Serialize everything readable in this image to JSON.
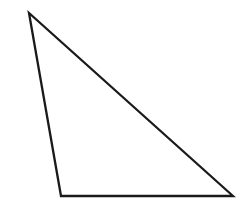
{
  "canvas": {
    "width": 247,
    "height": 215,
    "background_color": "#ffffff",
    "description": "Line drawing of a single scalene obtuse triangle outline"
  },
  "figure": {
    "name": "triangle",
    "shape_type": "triangle",
    "classification": "scalene obtuse triangle",
    "stroke_color": "#1a1a1a",
    "stroke_width": 2.3,
    "fill": "none",
    "points_attr": "29,13 61,196 233,196",
    "vertices": [
      {
        "label": "apex",
        "x": 29,
        "y": 13
      },
      {
        "label": "bottom-left",
        "x": 61,
        "y": 196
      },
      {
        "label": "bottom-right",
        "x": 233,
        "y": 196
      }
    ],
    "edges": [
      {
        "name": "left-edge",
        "from": "apex",
        "to": "bottom-left",
        "length_px": 186
      },
      {
        "name": "bottom-edge",
        "from": "bottom-left",
        "to": "bottom-right",
        "length_px": 172
      },
      {
        "name": "hypotenuse",
        "from": "bottom-right",
        "to": "apex",
        "length_px": 265
      }
    ],
    "angles_deg": {
      "apex": 44,
      "bottom-left": 106,
      "bottom-right": 30
    }
  }
}
